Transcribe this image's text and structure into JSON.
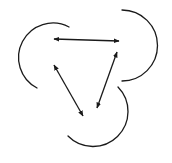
{
  "diagram": {
    "stroke_color": "#1a1a1a",
    "background": "#ffffff",
    "arcs": [
      {
        "name": "left-arc",
        "d": "M 69 27 A 32 32 0 1 0 37 88"
      },
      {
        "name": "right-arc",
        "d": "M 122 10 A 34 34 0 0 1 122 81"
      },
      {
        "name": "bottom-arc",
        "d": "M 118 87 A 32 32 0 0 1 68 136"
      }
    ],
    "arrows": [
      {
        "name": "top-arrow",
        "x1": 54,
        "y1": 39,
        "x2": 119,
        "y2": 41,
        "bidirectional": true
      },
      {
        "name": "left-diagonal-arrow",
        "x1": 54,
        "y1": 65,
        "x2": 83,
        "y2": 116,
        "bidirectional": true
      },
      {
        "name": "right-diagonal-arrow",
        "x1": 117,
        "y1": 52,
        "x2": 97,
        "y2": 108,
        "bidirectional": true
      }
    ]
  }
}
